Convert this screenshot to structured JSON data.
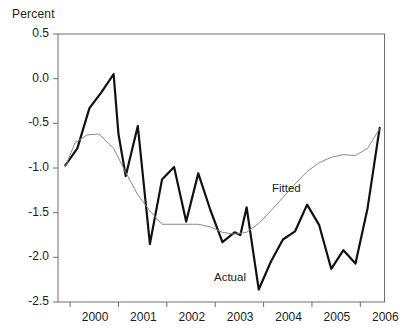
{
  "chart_data": {
    "type": "line",
    "title": "",
    "ylabel": "Percent",
    "xlabel": "",
    "ylim": [
      -2.5,
      0.5
    ],
    "xlim": [
      1999.75,
      2006.5
    ],
    "grid": false,
    "legend_position": "inline-annotations",
    "y_ticks": [
      0.5,
      0.0,
      -0.5,
      -1.0,
      -1.5,
      -2.0,
      -2.5
    ],
    "y_tick_labels": [
      "0.5",
      "0.0",
      "-0.5",
      "-1.0",
      "-1.5",
      "-2.0",
      "-2.5"
    ],
    "x_ticks": [
      2000,
      2001,
      2002,
      2003,
      2004,
      2005,
      2006
    ],
    "x_tick_labels": [
      "2000",
      "2001",
      "2002",
      "2003",
      "2004",
      "2005",
      "2006"
    ],
    "annotations": [
      {
        "text": "Fitted",
        "x": 2005.0,
        "y": -1.25
      },
      {
        "text": "Actual",
        "x": 2003.9,
        "y": -2.24
      }
    ],
    "series": [
      {
        "name": "Actual",
        "color": "#111111",
        "width": 2.2,
        "x": [
          1999.9,
          2000.15,
          2000.4,
          2000.65,
          2000.9,
          2001.0,
          2001.15,
          2001.4,
          2001.65,
          2001.9,
          2002.15,
          2002.4,
          2002.65,
          2002.9,
          2003.15,
          2003.4,
          2003.52,
          2003.65,
          2003.9,
          2004.15,
          2004.4,
          2004.65,
          2004.9,
          2005.15,
          2005.4,
          2005.65,
          2005.9,
          2006.15,
          2006.4
        ],
        "y": [
          -0.97,
          -0.78,
          -0.33,
          -0.15,
          0.05,
          -0.62,
          -1.09,
          -0.53,
          -1.85,
          -1.13,
          -0.99,
          -1.6,
          -1.06,
          -1.47,
          -1.83,
          -1.72,
          -1.75,
          -1.44,
          -2.36,
          -2.05,
          -1.8,
          -1.71,
          -1.41,
          -1.64,
          -2.13,
          -1.92,
          -2.07,
          -1.45,
          -0.55
        ]
      },
      {
        "name": "Fitted",
        "color": "#8a8a8a",
        "width": 1.0,
        "x": [
          1999.9,
          2000.1,
          2000.35,
          2000.6,
          2000.9,
          2001.15,
          2001.4,
          2001.65,
          2001.9,
          2002.15,
          2002.4,
          2002.65,
          2002.9,
          2003.15,
          2003.4,
          2003.65,
          2003.9,
          2004.15,
          2004.4,
          2004.65,
          2004.9,
          2005.15,
          2005.4,
          2005.65,
          2005.9,
          2006.15,
          2006.4
        ],
        "y": [
          -0.99,
          -0.72,
          -0.63,
          -0.62,
          -0.78,
          -1.05,
          -1.3,
          -1.48,
          -1.63,
          -1.63,
          -1.63,
          -1.63,
          -1.66,
          -1.72,
          -1.74,
          -1.72,
          -1.62,
          -1.48,
          -1.33,
          -1.18,
          -1.04,
          -0.94,
          -0.88,
          -0.85,
          -0.86,
          -0.78,
          -0.56
        ]
      }
    ]
  },
  "plot": {
    "frame_color": "#6e6e6e",
    "background": "#ffffff"
  }
}
